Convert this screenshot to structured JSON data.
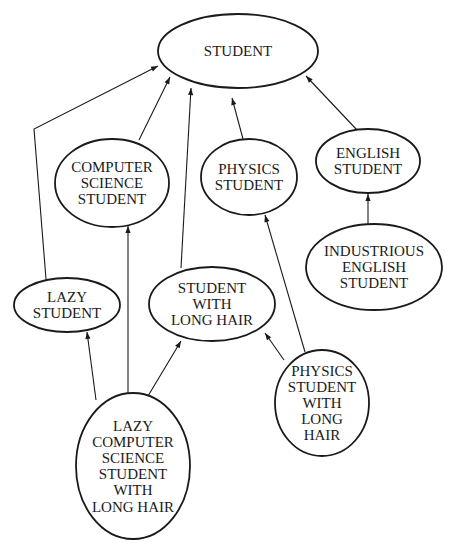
{
  "diagram": {
    "type": "inheritance-hierarchy",
    "nodes": [
      {
        "id": "student",
        "lines": [
          "STUDENT"
        ],
        "cx": 238,
        "cy": 51,
        "rx": 80,
        "ry": 37
      },
      {
        "id": "cs_student",
        "lines": [
          "COMPUTER",
          "SCIENCE",
          "STUDENT"
        ],
        "cx": 112,
        "cy": 183,
        "rx": 57,
        "ry": 44
      },
      {
        "id": "physics_student",
        "lines": [
          "PHYSICS",
          "STUDENT"
        ],
        "cx": 249,
        "cy": 177,
        "rx": 48,
        "ry": 38
      },
      {
        "id": "english_student",
        "lines": [
          "ENGLISH",
          "STUDENT"
        ],
        "cx": 368,
        "cy": 161,
        "rx": 52,
        "ry": 32
      },
      {
        "id": "industrious_english_student",
        "lines": [
          "INDUSTRIOUS",
          "ENGLISH",
          "STUDENT"
        ],
        "cx": 374,
        "cy": 267,
        "rx": 68,
        "ry": 43
      },
      {
        "id": "lazy_student",
        "lines": [
          "LAZY",
          "STUDENT"
        ],
        "cx": 67,
        "cy": 305,
        "rx": 53,
        "ry": 27
      },
      {
        "id": "student_long_hair",
        "lines": [
          "STUDENT",
          "WITH",
          "LONG HAIR"
        ],
        "cx": 212,
        "cy": 304,
        "rx": 63,
        "ry": 37
      },
      {
        "id": "physics_student_long_hair",
        "lines": [
          "PHYSICS",
          "STUDENT",
          "WITH",
          "LONG",
          "HAIR"
        ],
        "cx": 322,
        "cy": 403,
        "rx": 47,
        "ry": 53
      },
      {
        "id": "lazy_cs_student_long_hair",
        "lines": [
          "LAZY",
          "COMPUTER",
          "SCIENCE",
          "STUDENT",
          "WITH",
          "LONG HAIR"
        ],
        "cx": 133,
        "cy": 466,
        "rx": 57,
        "ry": 73
      }
    ],
    "edges": [
      {
        "from": "lazy_student",
        "to": "student",
        "points": [
          [
            46,
            279
          ],
          [
            34,
            129
          ],
          [
            158,
            66
          ]
        ]
      },
      {
        "from": "cs_student",
        "to": "student",
        "points": [
          [
            139,
            140
          ],
          [
            170,
            77
          ]
        ]
      },
      {
        "from": "student_long_hair",
        "to": "student",
        "points": [
          [
            181,
            268
          ],
          [
            191,
            88
          ]
        ]
      },
      {
        "from": "physics_student",
        "to": "student",
        "points": [
          [
            243,
            139
          ],
          [
            232,
            98
          ]
        ]
      },
      {
        "from": "english_student",
        "to": "student",
        "points": [
          [
            357,
            130
          ],
          [
            306,
            76
          ]
        ]
      },
      {
        "from": "industrious_english_student",
        "to": "english_student",
        "points": [
          [
            368,
            225
          ],
          [
            368,
            194
          ]
        ]
      },
      {
        "from": "lazy_cs_student_long_hair",
        "to": "lazy_student",
        "points": [
          [
            96,
            400
          ],
          [
            87,
            332
          ]
        ]
      },
      {
        "from": "lazy_cs_student_long_hair",
        "to": "cs_student",
        "points": [
          [
            128,
            393
          ],
          [
            128,
            226
          ]
        ]
      },
      {
        "from": "lazy_cs_student_long_hair",
        "to": "student_long_hair",
        "points": [
          [
            148,
            396
          ],
          [
            181,
            341
          ]
        ]
      },
      {
        "from": "physics_student_long_hair",
        "to": "physics_student",
        "points": [
          [
            305,
            352
          ],
          [
            265,
            215
          ]
        ]
      },
      {
        "from": "physics_student_long_hair",
        "to": "student_long_hair",
        "points": [
          [
            284,
            360
          ],
          [
            265,
            333
          ]
        ]
      }
    ]
  }
}
